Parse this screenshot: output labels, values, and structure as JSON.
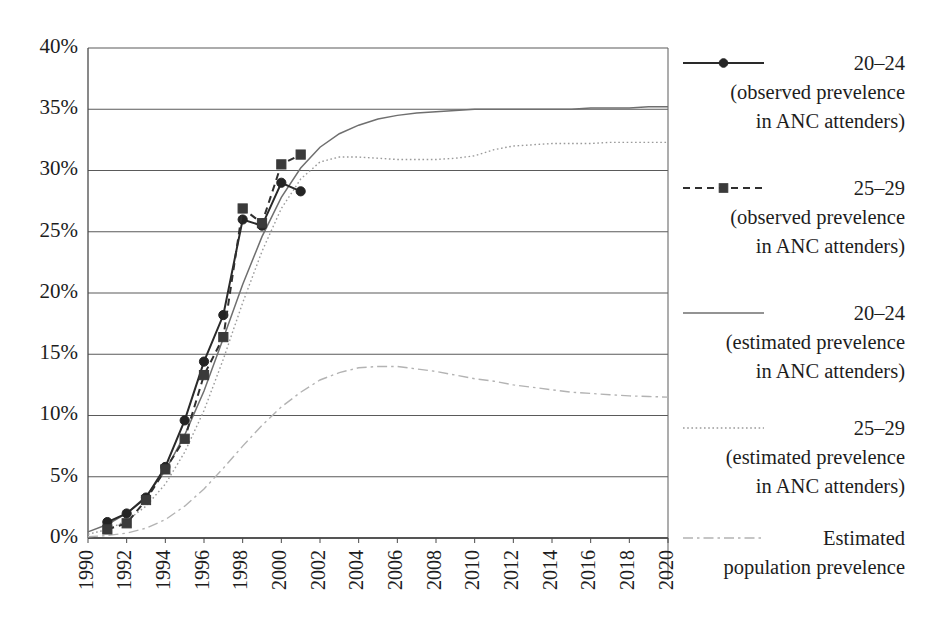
{
  "chart_data": {
    "type": "line",
    "title": "",
    "xlabel": "",
    "ylabel": "",
    "xlim": [
      1990,
      2020
    ],
    "ylim": [
      0,
      40
    ],
    "grid": true,
    "legend_position": "right",
    "y_unit": "%",
    "x_tick_labels": [
      "1990",
      "1992",
      "1994",
      "1996",
      "1998",
      "2000",
      "2002",
      "2004",
      "2006",
      "2008",
      "2010",
      "2012",
      "2014",
      "2016",
      "2018",
      "2020"
    ],
    "y_tick_labels": [
      "0%",
      "5%",
      "10%",
      "15%",
      "20%",
      "25%",
      "30%",
      "35%",
      "40%"
    ],
    "y_tick_values": [
      0,
      5,
      10,
      15,
      20,
      25,
      30,
      35,
      40
    ],
    "series": [
      {
        "name": "20-24 (observed prevelence in ANC attenders)",
        "label_main": "20–24",
        "label_line2": "(observed prevelence",
        "label_line3": "in ANC attenders)",
        "style": "solid",
        "marker": "circle",
        "color": "#242424",
        "x": [
          1991,
          1992,
          1993,
          1994,
          1995,
          1996,
          1997,
          1998,
          1999,
          2000,
          2001
        ],
        "values": [
          1.3,
          2.0,
          3.3,
          5.8,
          9.6,
          14.4,
          18.2,
          26.0,
          25.5,
          29.0,
          28.3
        ]
      },
      {
        "name": "25-29 (observed prevelence in ANC attenders)",
        "label_main": "25–29",
        "label_line2": "(observed prevelence",
        "label_line3": "in ANC attenders)",
        "style": "dashed",
        "marker": "square",
        "color": "#3a3a3a",
        "x": [
          1991,
          1992,
          1993,
          1994,
          1995,
          1996,
          1997,
          1998,
          1999,
          2000,
          2001
        ],
        "values": [
          0.7,
          1.2,
          3.1,
          5.6,
          8.1,
          13.3,
          16.4,
          26.9,
          25.7,
          30.5,
          31.3
        ]
      },
      {
        "name": "20-24 (estimated prevelence in ANC attenders)",
        "label_main": "20–24",
        "label_line2": "(estimated prevelence",
        "label_line3": "in ANC attenders)",
        "style": "solid-thin",
        "marker": "none",
        "color": "#6f6f6f",
        "x": [
          1990,
          1991,
          1992,
          1993,
          1994,
          1995,
          1996,
          1997,
          1998,
          1999,
          2000,
          2001,
          2002,
          2003,
          2004,
          2005,
          2006,
          2007,
          2008,
          2009,
          2010,
          2011,
          2012,
          2013,
          2014,
          2015,
          2016,
          2017,
          2018,
          2019,
          2020
        ],
        "values": [
          0.5,
          1.1,
          2.0,
          3.4,
          5.5,
          8.4,
          12.0,
          16.3,
          20.7,
          24.6,
          27.8,
          30.2,
          31.9,
          33.0,
          33.7,
          34.2,
          34.5,
          34.7,
          34.8,
          34.9,
          35.0,
          35.0,
          35.0,
          35.0,
          35.0,
          35.0,
          35.1,
          35.1,
          35.1,
          35.2,
          35.2
        ]
      },
      {
        "name": "25-29 (estimated prevelence in ANC attenders)",
        "label_main": "25–29",
        "label_line2": "(estimated prevelence",
        "label_line3": "in ANC attenders)",
        "style": "dotted",
        "marker": "none",
        "color": "#9a9a9a",
        "x": [
          1990,
          1991,
          1992,
          1993,
          1994,
          1995,
          1996,
          1997,
          1998,
          1999,
          2000,
          2001,
          2002,
          2003,
          2004,
          2005,
          2006,
          2007,
          2008,
          2009,
          2010,
          2011,
          2012,
          2013,
          2014,
          2015,
          2016,
          2017,
          2018,
          2019,
          2020
        ],
        "values": [
          0.3,
          0.7,
          1.4,
          2.6,
          4.4,
          7.0,
          10.4,
          14.6,
          19.2,
          23.4,
          26.9,
          29.3,
          30.7,
          31.1,
          31.1,
          31.0,
          30.9,
          30.9,
          30.9,
          31.0,
          31.2,
          31.7,
          32.0,
          32.1,
          32.2,
          32.2,
          32.2,
          32.3,
          32.3,
          32.3,
          32.3
        ]
      },
      {
        "name": "Estimated population prevelence",
        "label_main": "Estimated",
        "label_line2": "population prevelence",
        "label_line3": "",
        "style": "dash-dot",
        "marker": "none",
        "color": "#b3b3b3",
        "x": [
          1990,
          1991,
          1992,
          1993,
          1994,
          1995,
          1996,
          1997,
          1998,
          1999,
          2000,
          2001,
          2002,
          2003,
          2004,
          2005,
          2006,
          2007,
          2008,
          2009,
          2010,
          2011,
          2012,
          2013,
          2014,
          2015,
          2016,
          2017,
          2018,
          2019,
          2020
        ],
        "values": [
          0.1,
          0.2,
          0.4,
          0.8,
          1.5,
          2.6,
          4.0,
          5.7,
          7.5,
          9.2,
          10.7,
          11.9,
          12.9,
          13.5,
          13.9,
          14.0,
          14.0,
          13.8,
          13.6,
          13.3,
          13.0,
          12.8,
          12.5,
          12.3,
          12.1,
          11.9,
          11.8,
          11.7,
          11.6,
          11.55,
          11.5
        ]
      }
    ]
  },
  "legend": {
    "entries": [
      {
        "main": "20–24",
        "line2": "(observed prevelence",
        "line3": "in ANC attenders)",
        "style": "solid",
        "marker": "circle"
      },
      {
        "main": "25–29",
        "line2": "(observed prevelence",
        "line3": "in ANC attenders)",
        "style": "dashed",
        "marker": "square"
      },
      {
        "main": "20–24",
        "line2": "(estimated prevelence",
        "line3": "in ANC attenders)",
        "style": "solid-thin",
        "marker": "none"
      },
      {
        "main": "25–29",
        "line2": "(estimated prevelence",
        "line3": "in ANC attenders)",
        "style": "dotted",
        "marker": "none"
      },
      {
        "main": "Estimated",
        "line2": "population prevelence",
        "line3": "",
        "style": "dash-dot",
        "marker": "none"
      }
    ]
  },
  "colors": {
    "background": "#ffffff",
    "grid": "#5a5a5a",
    "axis": "#4a4a4a",
    "text": "#1d1d1d"
  }
}
